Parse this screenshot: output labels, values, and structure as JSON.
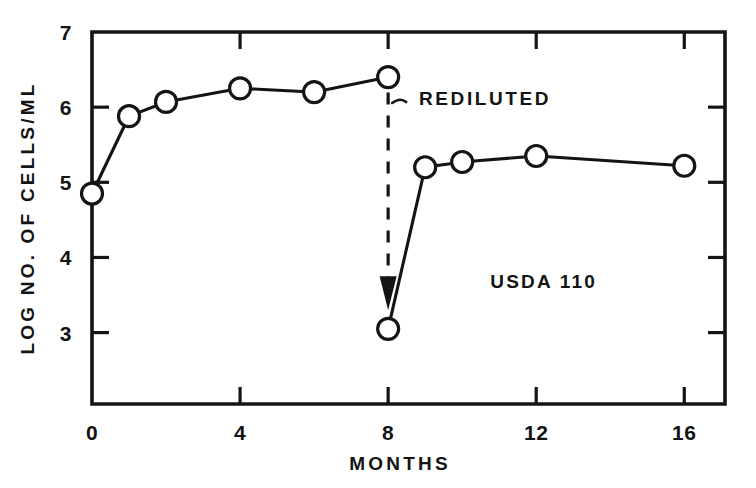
{
  "chart_data": {
    "type": "line",
    "title": "",
    "xlabel": "MONTHS",
    "ylabel": "LOG NO. OF CELLS/ML",
    "xlim": [
      0,
      17.1
    ],
    "ylim": [
      2.05,
      7.0
    ],
    "xticks": [
      0,
      4,
      8,
      12,
      16
    ],
    "xtick_labels": [
      "0",
      "4",
      "8",
      "12",
      "16"
    ],
    "yticks": [
      3,
      4,
      5,
      6,
      7
    ],
    "ytick_labels": [
      "3",
      "4",
      "5",
      "6",
      "7"
    ],
    "grid": false,
    "legend": "none",
    "marker": "open-circle",
    "series": [
      {
        "name": "before-redilution",
        "x": [
          0,
          1,
          2,
          4,
          6,
          8
        ],
        "values": [
          4.85,
          5.88,
          6.07,
          6.25,
          6.2,
          6.4
        ]
      },
      {
        "name": "after-redilution",
        "x": [
          8,
          9,
          10,
          12,
          16
        ],
        "values": [
          3.05,
          5.2,
          5.27,
          5.35,
          5.22
        ]
      }
    ],
    "annotations": [
      {
        "name": "redilution",
        "text": "REDILUTED",
        "x": 8,
        "y_from": 6.4,
        "y_to": 3.05,
        "style": "dashed-arrow"
      },
      {
        "name": "strain",
        "text": "USDA 110",
        "x": 12.2,
        "y": 3.6,
        "style": "plain-text"
      }
    ]
  },
  "axes": {
    "x_title": "MONTHS",
    "y_title": "LOG NO. OF CELLS/ML",
    "x_tick_labels": [
      "0",
      "4",
      "8",
      "12",
      "16"
    ],
    "y_tick_labels": [
      "3",
      "4",
      "5",
      "6",
      "7"
    ]
  },
  "annotations": {
    "redilution_label": "REDILUTED",
    "strain_label": "USDA 110"
  },
  "style": {
    "ink": "#141414",
    "paper": "#ffffff",
    "marker_fill": "#ffffff"
  }
}
